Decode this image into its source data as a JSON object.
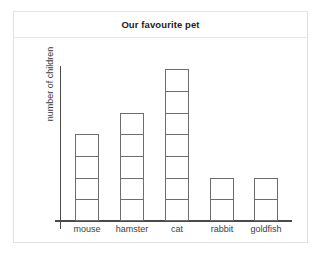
{
  "card": {
    "title": "Our favourite pet"
  },
  "chart_data": {
    "type": "bar",
    "title": "Our favourite pet",
    "xlabel": "",
    "ylabel": "number of children",
    "categories": [
      "mouse",
      "hamster",
      "cat",
      "rabbit",
      "goldfish"
    ],
    "values": [
      4,
      5,
      7,
      2,
      2
    ],
    "ylim": [
      0,
      8
    ],
    "grid": false,
    "legend": false,
    "style": {
      "bar_fill": "#ffffff",
      "bar_stroke": "#6d6d6d",
      "axis_color": "#4a4a4a",
      "text_color": "#3d3d3d",
      "card_border": "#e2e2e2",
      "background": "#ffffff"
    }
  }
}
